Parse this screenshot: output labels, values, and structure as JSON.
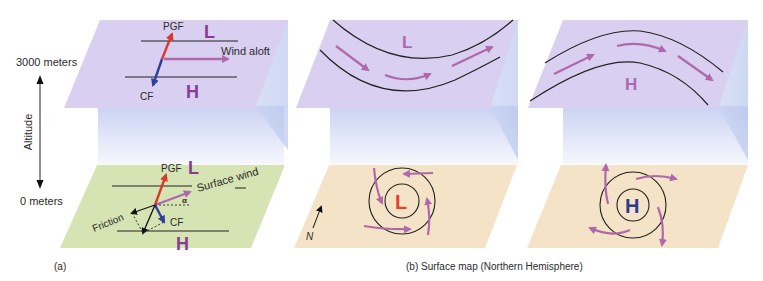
{
  "colors": {
    "upper_plane": "#d9cff0",
    "column_top": "#cfd6f3",
    "column_bottom": "#f4f6fd",
    "surface_plane_a": "#d6e4b3",
    "surface_plane_b": "#f4e3c6",
    "pgf_arrow": "#d9392b",
    "cf_arrow": "#2f3f9e",
    "wind_arrow": "#b068ad",
    "low_label": "#8a3c93",
    "high_label_a": "#8a3c93",
    "low_label_surface": "#e2452f",
    "high_label_surface": "#2e3b8f",
    "isobar": "#222222"
  },
  "axis": {
    "top_label": "3000 meters",
    "bottom_label": "0 meters",
    "axis_title": "Altitude"
  },
  "panel_a": {
    "caption": "(a)",
    "aloft": {
      "low": "L",
      "high": "H",
      "pgf": "PGF",
      "cf": "CF",
      "wind": "Wind aloft"
    },
    "surface": {
      "low": "L",
      "high": "H",
      "pgf": "PGF",
      "cf": "CF",
      "wind": "Surface wind",
      "friction": "Friction",
      "angle": "α"
    }
  },
  "panel_b": {
    "caption": "(b)  Surface map (Northern Hemisphere)",
    "trough": {
      "aloft_label": "L",
      "surface_label": "L"
    },
    "ridge": {
      "aloft_label": "H",
      "surface_label": "H"
    },
    "north": "N"
  }
}
